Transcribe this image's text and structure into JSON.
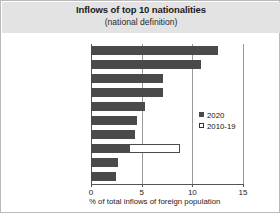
{
  "chart_data": {
    "type": "bar",
    "orientation": "horizontal",
    "title": "Inflows of top 10 nationalities",
    "subtitle": "(national definition)",
    "xlabel": "% of total inflows of foreign population",
    "ylabel": "",
    "xlim": [
      0,
      15
    ],
    "xticks": [
      0,
      5,
      10,
      15
    ],
    "xtick_labels": [
      "0",
      "5",
      "10",
      "15"
    ],
    "grid": true,
    "legend_position": "center-right",
    "categories": [
      "Colombia",
      "Morocco",
      "Venezuela",
      "United Kingdom",
      "Italy",
      "Honduras",
      "Peru",
      "Romania",
      "Argentina",
      "France"
    ],
    "series": [
      {
        "name": "2020",
        "color": "#4a4a4a",
        "style": "filled",
        "values": [
          12.5,
          10.9,
          7.1,
          7.1,
          5.3,
          4.5,
          4.3,
          3.8,
          2.7,
          2.5
        ]
      },
      {
        "name": "2010-19",
        "color": "#ffffff",
        "style": "hollow",
        "values": [
          6.8,
          9.2,
          5.2,
          5.1,
          5.3,
          3.1,
          2.9,
          8.8,
          2.1,
          2.5
        ]
      }
    ]
  },
  "colors": {
    "series_2020": "#4a4a4a",
    "series_2010_19": "#ffffff",
    "banner": "#e3e3e3",
    "grid": "#9a9a9a",
    "axis": "#555555",
    "frame": "#b9b9b9"
  }
}
